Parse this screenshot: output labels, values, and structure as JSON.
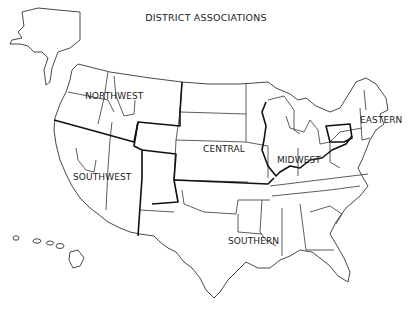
{
  "title": "DISTRICT ASSOCIATIONS",
  "regions": [
    {
      "name": "NORTHWEST",
      "x": 85,
      "y": 91
    },
    {
      "name": "SOUTHWEST",
      "x": 73,
      "y": 172
    },
    {
      "name": "CENTRAL",
      "x": 203,
      "y": 144
    },
    {
      "name": "MIDWEST",
      "x": 277,
      "y": 155
    },
    {
      "name": "EASTERN",
      "x": 360,
      "y": 115
    },
    {
      "name": "SOUTHERN",
      "x": 228,
      "y": 236
    }
  ],
  "colors": {
    "background": "#ffffff",
    "lines": "#333333",
    "text": "#222222"
  }
}
